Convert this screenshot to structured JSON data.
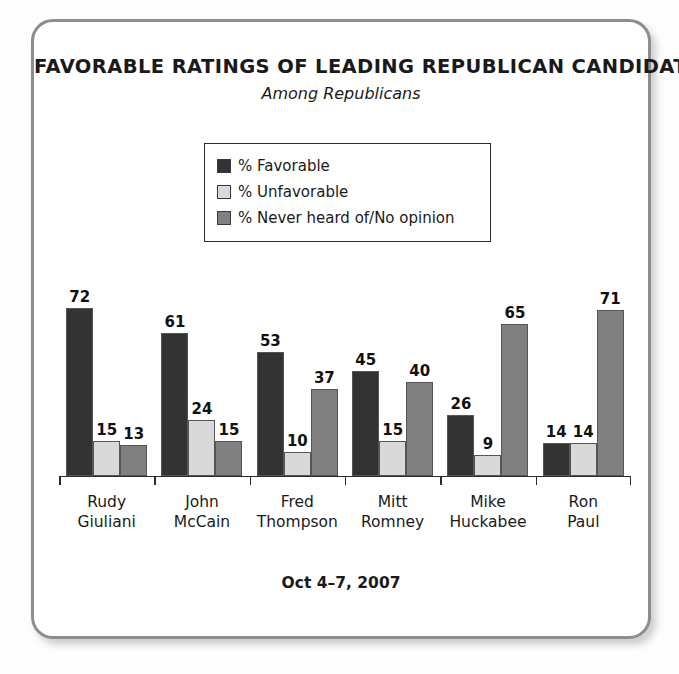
{
  "card": {
    "border_color": "#8d8d8d",
    "background": "#ffffff"
  },
  "header": {
    "title": "FAVORABLE RATINGS OF LEADING REPUBLICAN CANDIDATES",
    "subtitle": "Among Republicans"
  },
  "legend": {
    "position": "upper-center",
    "entries": [
      {
        "label": "% Favorable",
        "color": "#333333"
      },
      {
        "label": "% Unfavorable",
        "color": "#d9d9d9"
      },
      {
        "label": "% Never heard of/No opinion",
        "color": "#808080"
      }
    ]
  },
  "footer": {
    "note": "Oct 4–7, 2007"
  },
  "chart_data": {
    "type": "bar",
    "title": "FAVORABLE RATINGS OF LEADING REPUBLICAN CANDIDATES",
    "subtitle": "Among Republicans",
    "xlabel": "",
    "ylabel": "",
    "ylim": [
      0,
      80
    ],
    "grid": false,
    "legend_position": "upper-center",
    "annotation": "Oct 4–7, 2007",
    "categories": [
      "Rudy Giuliani",
      "John McCain",
      "Fred Thompson",
      "Mitt Romney",
      "Mike Huckabee",
      "Ron Paul"
    ],
    "category_lines": [
      [
        "Rudy",
        "Giuliani"
      ],
      [
        "John",
        "McCain"
      ],
      [
        "Fred",
        "Thompson"
      ],
      [
        "Mitt",
        "Romney"
      ],
      [
        "Mike",
        "Huckabee"
      ],
      [
        "Ron",
        "Paul"
      ]
    ],
    "series": [
      {
        "name": "% Favorable",
        "color": "#333333",
        "values": [
          72,
          61,
          53,
          45,
          26,
          14
        ]
      },
      {
        "name": "% Unfavorable",
        "color": "#d9d9d9",
        "values": [
          15,
          24,
          10,
          15,
          9,
          14
        ]
      },
      {
        "name": "% Never heard of/No opinion",
        "color": "#808080",
        "values": [
          13,
          15,
          37,
          40,
          65,
          71
        ]
      }
    ]
  }
}
